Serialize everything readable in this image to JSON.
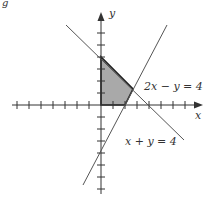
{
  "figure": {
    "corner_fragment": "g",
    "axes": {
      "x_label": "x",
      "y_label": "y"
    },
    "lines": [
      {
        "equation": "2x − y = 4",
        "label": "2x − y = 4"
      },
      {
        "equation": "x + y = 4",
        "label": "x + y = 4"
      }
    ],
    "region": {
      "vertices": [
        [
          0,
          0
        ],
        [
          0,
          4
        ],
        [
          2.6667,
          1.3333
        ],
        [
          2,
          0
        ]
      ],
      "fill": "#a9a9a9",
      "stroke": "#222222"
    },
    "scale_px_per_unit": 12,
    "origin_px": [
      101,
      105
    ],
    "x_ticks": [
      -7,
      -6,
      -5,
      -4,
      -3,
      -2,
      -1,
      1,
      2,
      3,
      4,
      5,
      6,
      7
    ],
    "y_ticks": [
      -7,
      -6,
      -5,
      -4,
      -3,
      -2,
      -1,
      1,
      2,
      3,
      4,
      5,
      6
    ]
  }
}
